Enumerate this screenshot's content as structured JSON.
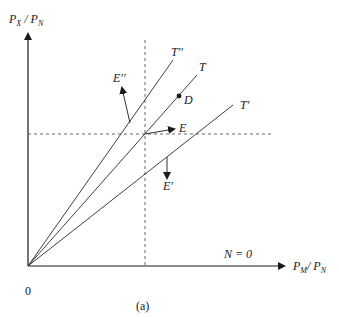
{
  "figure": {
    "caption": "(a)",
    "origin_label": "0",
    "y_axis": {
      "label_main": "P",
      "label_sub1": "X",
      "label_sep": " / P",
      "label_sub2": "N"
    },
    "x_axis": {
      "label_main": "P",
      "label_sub1": "M",
      "label_sep": "/ P",
      "label_sub2": "N"
    },
    "region_label": "N = 0",
    "rays": [
      {
        "name": "T''",
        "label": "T′′"
      },
      {
        "name": "T",
        "label": "T"
      },
      {
        "name": "T'",
        "label": "T′"
      }
    ],
    "points": [
      {
        "name": "D",
        "label": "D"
      }
    ],
    "arrows": [
      {
        "name": "E",
        "label": "E"
      },
      {
        "name": "E''",
        "label": "E′′"
      },
      {
        "name": "E'",
        "label": "E′"
      }
    ],
    "colors": {
      "line": "#2a2a2a",
      "dashed": "#555555"
    }
  }
}
